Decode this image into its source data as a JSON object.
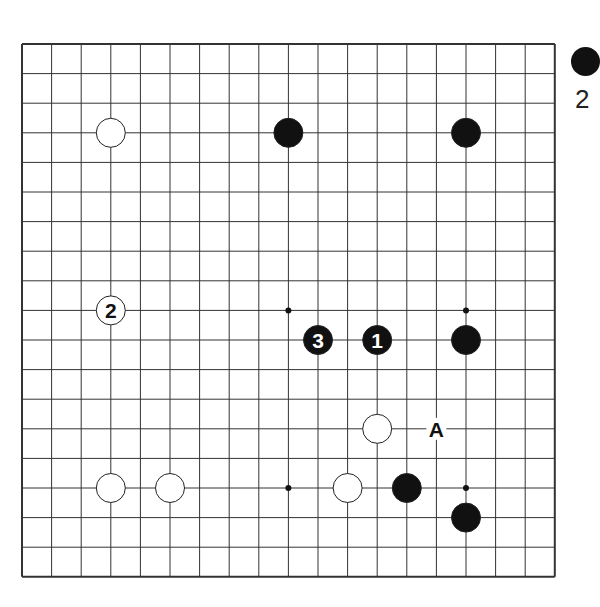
{
  "diagram": {
    "type": "go-board",
    "size": 19,
    "origin": {
      "x": 22,
      "y": 44
    },
    "spacing": 29.6,
    "colors": {
      "line": "#333333",
      "black": "#111111",
      "white": "#ffffff",
      "background": "#ffffff"
    },
    "star_points": [
      [
        9,
        9
      ],
      [
        15,
        9
      ],
      [
        9,
        15
      ],
      [
        15,
        15
      ]
    ],
    "stones": [
      {
        "color": "white",
        "col": 3,
        "row": 3,
        "label": ""
      },
      {
        "color": "black",
        "col": 9,
        "row": 3,
        "label": ""
      },
      {
        "color": "black",
        "col": 15,
        "row": 3,
        "label": ""
      },
      {
        "color": "white",
        "col": 3,
        "row": 9,
        "label": "2"
      },
      {
        "color": "black",
        "col": 10,
        "row": 10,
        "label": "3"
      },
      {
        "color": "black",
        "col": 12,
        "row": 10,
        "label": "1"
      },
      {
        "color": "black",
        "col": 15,
        "row": 10,
        "label": ""
      },
      {
        "color": "white",
        "col": 12,
        "row": 13,
        "label": ""
      },
      {
        "color": "white",
        "col": 3,
        "row": 15,
        "label": ""
      },
      {
        "color": "white",
        "col": 5,
        "row": 15,
        "label": ""
      },
      {
        "color": "white",
        "col": 11,
        "row": 15,
        "label": ""
      },
      {
        "color": "black",
        "col": 13,
        "row": 15,
        "label": ""
      },
      {
        "color": "black",
        "col": 15,
        "row": 16,
        "label": ""
      }
    ],
    "markers": [
      {
        "col": 14,
        "row": 13,
        "label": "A"
      }
    ]
  },
  "side_caption": {
    "stone_color": "black",
    "text": "2"
  }
}
